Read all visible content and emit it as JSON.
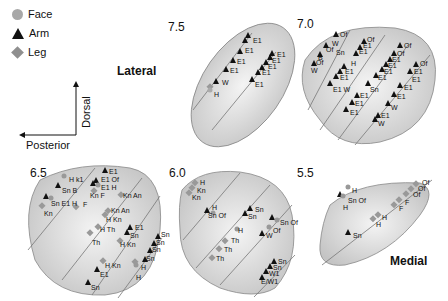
{
  "legend": {
    "items": [
      {
        "label": "Face",
        "symbol": "circle",
        "color": "#a8a8a8"
      },
      {
        "label": "Arm",
        "symbol": "triangle",
        "color": "#111111"
      },
      {
        "label": "Leg",
        "symbol": "diamond",
        "color": "#8f8f8f"
      }
    ]
  },
  "axes": {
    "vertical": "Dorsal",
    "horizontal": "Posterior"
  },
  "orientation_labels": {
    "lateral": "Lateral",
    "medial": "Medial"
  },
  "panels": [
    {
      "id": "p75",
      "label": "7.5",
      "annotations": [
        "E1",
        "E1",
        "E1",
        "E1",
        "W",
        "H",
        "E1",
        "E1",
        "E1",
        "E1",
        "E1"
      ]
    },
    {
      "id": "p70",
      "label": "7.0",
      "annotations": [
        "Of",
        "W",
        "Of",
        "Sn",
        "B",
        "Of",
        "W",
        "E1",
        "Of",
        "E1",
        "E1",
        "H",
        "E1",
        "E1",
        "E1",
        "E1 W",
        "Of",
        "Of",
        "E1",
        "E1",
        "E1",
        "E1",
        "Sn",
        "E1",
        "E1",
        "Of",
        "E1",
        "E1",
        "E1",
        "E1",
        "W",
        "E1",
        "W"
      ]
    },
    {
      "id": "p65",
      "label": "6.5",
      "annotations": [
        "H k1",
        "Sn B",
        "Sn E1 H",
        "Kn",
        "E1",
        "E1 Of",
        "E1 H",
        "Kn F",
        "F",
        "Kn An",
        "Kn An",
        "H Kn",
        "H Th",
        "Th",
        "E1",
        "Sn",
        "H Kn",
        "H Kn",
        "E1",
        "Sn",
        "Sn",
        "Sn",
        "Sn",
        "Sn",
        "H",
        "H"
      ]
    },
    {
      "id": "p60",
      "label": "6.0",
      "annotations": [
        "H",
        "Kn",
        "Kn",
        "H",
        "Sn Of",
        "Sn",
        "Sn",
        "H",
        "Th",
        "Th",
        "Th",
        "Sn Of",
        "Of",
        "W",
        "Sn",
        "Sn",
        "W1",
        "E/W1"
      ]
    },
    {
      "id": "p55",
      "label": "5.5",
      "annotations": [
        "H",
        "Sn Of",
        "H",
        "Of",
        "Of",
        "Of",
        "F",
        "F",
        "H",
        "H",
        "Sn"
      ]
    }
  ]
}
